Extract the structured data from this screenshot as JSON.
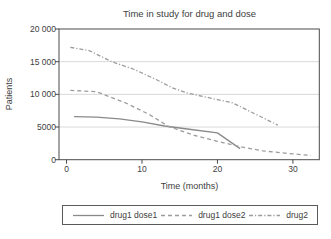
{
  "chart_data": {
    "type": "line",
    "title": "Time in study for drug and dose",
    "xlabel": "Time (months)",
    "ylabel": "Patients",
    "xlim": [
      -1,
      33.5
    ],
    "ylim": [
      0,
      20000
    ],
    "x_ticks": [
      0,
      10,
      20,
      30
    ],
    "x_tick_labels": [
      "0",
      "10",
      "20",
      "30"
    ],
    "y_ticks": [
      0,
      5000,
      10000,
      15000,
      20000
    ],
    "y_tick_labels": [
      "0",
      "5000",
      "10 000",
      "15 000",
      "20 000"
    ],
    "grid": "horizontal-light",
    "frame": "full-box",
    "legend_position": "bottom-box",
    "series": [
      {
        "name": "drug1 dose1",
        "line_style": "solid",
        "color": "#8a8a8a",
        "points": [
          [
            1,
            6600
          ],
          [
            4,
            6500
          ],
          [
            7,
            6250
          ],
          [
            10,
            5800
          ],
          [
            13,
            5150
          ],
          [
            16,
            4700
          ],
          [
            20,
            4100
          ],
          [
            23,
            1700
          ]
        ]
      },
      {
        "name": "drug1 dose2",
        "line_style": "dashed",
        "color": "#9c9c9c",
        "points": [
          [
            0.5,
            10600
          ],
          [
            4,
            10400
          ],
          [
            8,
            8600
          ],
          [
            11,
            6900
          ],
          [
            13.5,
            5100
          ],
          [
            17,
            3700
          ],
          [
            20,
            2800
          ],
          [
            23,
            2000
          ],
          [
            26,
            1350
          ],
          [
            29,
            1000
          ],
          [
            32.4,
            650
          ]
        ]
      },
      {
        "name": "drug2",
        "line_style": "dashdot",
        "color": "#9c9c9c",
        "points": [
          [
            0.5,
            17200
          ],
          [
            3,
            16700
          ],
          [
            6,
            15000
          ],
          [
            9,
            13800
          ],
          [
            12,
            12200
          ],
          [
            14,
            11000
          ],
          [
            16,
            10200
          ],
          [
            18,
            9700
          ],
          [
            20,
            9200
          ],
          [
            22,
            8700
          ],
          [
            25,
            7000
          ],
          [
            28,
            5300
          ]
        ]
      }
    ]
  },
  "colors": {
    "background": "#ffffff",
    "axis": "#4a4a4a",
    "grid": "#d9d9d9",
    "text": "#404040",
    "legend_border": "#5a5a5a"
  }
}
